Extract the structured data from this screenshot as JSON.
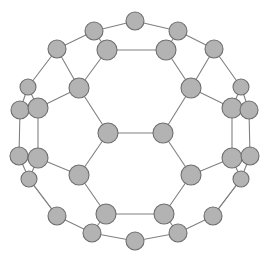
{
  "figure": {
    "type": "graph-diagram",
    "background_color": "#ffffff",
    "node_fill_color": "#b3b3b3",
    "node_stroke_color": "#6e6e6e",
    "edge_color": "#808080",
    "node_count": 34,
    "edge_count": 51,
    "width": 268,
    "height": 262
  },
  "graph_data": {
    "type": "graph",
    "layout": "planar-embedding",
    "nodes": [
      {
        "id": 0,
        "label": "n0",
        "x": 135,
        "y": 21,
        "r": 9
      },
      {
        "id": 1,
        "label": "n1",
        "x": 94,
        "y": 31,
        "r": 9
      },
      {
        "id": 2,
        "label": "n2",
        "x": 178,
        "y": 31,
        "r": 9
      },
      {
        "id": 3,
        "label": "n3",
        "x": 57,
        "y": 49,
        "r": 9
      },
      {
        "id": 4,
        "label": "n4",
        "x": 214,
        "y": 49,
        "r": 9
      },
      {
        "id": 5,
        "label": "n5",
        "x": 107,
        "y": 50,
        "r": 10
      },
      {
        "id": 6,
        "label": "n6",
        "x": 166,
        "y": 50,
        "r": 10
      },
      {
        "id": 7,
        "label": "n7",
        "x": 28,
        "y": 87,
        "r": 8
      },
      {
        "id": 8,
        "label": "n8",
        "x": 241,
        "y": 87,
        "r": 8
      },
      {
        "id": 9,
        "label": "n9",
        "x": 79,
        "y": 88,
        "r": 10
      },
      {
        "id": 10,
        "label": "n10",
        "x": 191,
        "y": 88,
        "r": 10
      },
      {
        "id": 11,
        "label": "n11",
        "x": 20,
        "y": 110,
        "r": 9
      },
      {
        "id": 12,
        "label": "n12",
        "x": 38,
        "y": 108,
        "r": 10
      },
      {
        "id": 13,
        "label": "n13",
        "x": 232,
        "y": 108,
        "r": 10
      },
      {
        "id": 14,
        "label": "n14",
        "x": 249,
        "y": 110,
        "r": 9
      },
      {
        "id": 15,
        "label": "n15",
        "x": 108,
        "y": 133,
        "r": 10
      },
      {
        "id": 16,
        "label": "n16",
        "x": 163,
        "y": 133,
        "r": 10
      },
      {
        "id": 17,
        "label": "n17",
        "x": 19,
        "y": 156,
        "r": 9
      },
      {
        "id": 18,
        "label": "n18",
        "x": 38,
        "y": 158,
        "r": 10
      },
      {
        "id": 19,
        "label": "n19",
        "x": 232,
        "y": 158,
        "r": 10
      },
      {
        "id": 20,
        "label": "n20",
        "x": 250,
        "y": 156,
        "r": 9
      },
      {
        "id": 21,
        "label": "n21",
        "x": 29,
        "y": 179,
        "r": 8
      },
      {
        "id": 22,
        "label": "n22",
        "x": 241,
        "y": 179,
        "r": 8
      },
      {
        "id": 23,
        "label": "n23",
        "x": 79,
        "y": 175,
        "r": 10
      },
      {
        "id": 24,
        "label": "n24",
        "x": 191,
        "y": 175,
        "r": 10
      },
      {
        "id": 25,
        "label": "n25",
        "x": 57,
        "y": 216,
        "r": 9
      },
      {
        "id": 26,
        "label": "n26",
        "x": 213,
        "y": 216,
        "r": 9
      },
      {
        "id": 27,
        "label": "n27",
        "x": 106,
        "y": 214,
        "r": 10
      },
      {
        "id": 28,
        "label": "n28",
        "x": 164,
        "y": 214,
        "r": 10
      },
      {
        "id": 29,
        "label": "n29",
        "x": 92,
        "y": 233,
        "r": 9
      },
      {
        "id": 30,
        "label": "n30",
        "x": 178,
        "y": 233,
        "r": 9
      },
      {
        "id": 31,
        "label": "n31",
        "x": 135,
        "y": 241,
        "r": 9
      },
      {
        "id": 32,
        "label": "n32",
        "x": 14,
        "y": 133,
        "r": 0
      },
      {
        "id": 33,
        "label": "n33",
        "x": 255,
        "y": 133,
        "r": 0
      }
    ],
    "edges": [
      [
        0,
        1
      ],
      [
        0,
        2
      ],
      [
        1,
        3
      ],
      [
        2,
        4
      ],
      [
        1,
        5
      ],
      [
        2,
        6
      ],
      [
        5,
        6
      ],
      [
        3,
        7
      ],
      [
        4,
        8
      ],
      [
        3,
        9
      ],
      [
        4,
        10
      ],
      [
        5,
        9
      ],
      [
        6,
        10
      ],
      [
        7,
        11
      ],
      [
        7,
        12
      ],
      [
        11,
        12
      ],
      [
        8,
        13
      ],
      [
        8,
        14
      ],
      [
        13,
        14
      ],
      [
        9,
        12
      ],
      [
        10,
        13
      ],
      [
        11,
        17
      ],
      [
        12,
        18
      ],
      [
        14,
        20
      ],
      [
        13,
        19
      ],
      [
        9,
        15
      ],
      [
        10,
        16
      ],
      [
        15,
        16
      ],
      [
        15,
        23
      ],
      [
        16,
        24
      ],
      [
        17,
        18
      ],
      [
        17,
        21
      ],
      [
        18,
        21
      ],
      [
        19,
        20
      ],
      [
        19,
        22
      ],
      [
        20,
        22
      ],
      [
        18,
        23
      ],
      [
        19,
        24
      ],
      [
        21,
        25
      ],
      [
        22,
        26
      ],
      [
        23,
        27
      ],
      [
        24,
        28
      ],
      [
        27,
        28
      ],
      [
        25,
        29
      ],
      [
        26,
        30
      ],
      [
        27,
        29
      ],
      [
        28,
        30
      ],
      [
        29,
        31
      ],
      [
        30,
        31
      ],
      [
        25,
        21
      ],
      [
        26,
        22
      ]
    ]
  }
}
